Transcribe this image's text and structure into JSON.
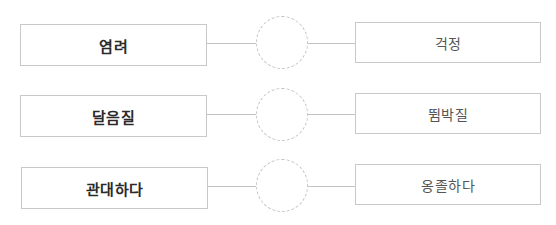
{
  "pairs": [
    {
      "left": "염려",
      "right": "걱정",
      "answer": ""
    },
    {
      "left": "달음질",
      "right": "뜀박질",
      "answer": ""
    },
    {
      "left": "관대하다",
      "right": "옹졸하다",
      "answer": ""
    }
  ],
  "colors": {
    "border": "#c9c9c9",
    "circle_border": "#c4c4c4",
    "left_text": "#2a2a2a",
    "right_text": "#555555"
  }
}
